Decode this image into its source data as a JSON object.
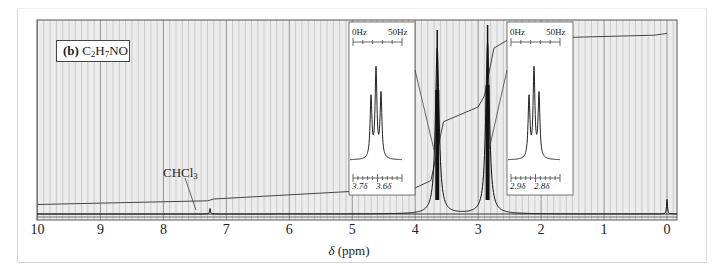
{
  "figure": {
    "panel_label": "(b)",
    "formula_parts": [
      "C",
      "2",
      "H",
      "7",
      "NO"
    ],
    "solvent_annotation": {
      "text": "CHCl",
      "sub": "3"
    }
  },
  "axis": {
    "xlabel_symbol": "δ",
    "xlabel_unit": "(ppm)",
    "ticks": [
      "10",
      "9",
      "8",
      "7",
      "6",
      "5",
      "4",
      "3",
      "2",
      "1",
      "0"
    ]
  },
  "insets": [
    {
      "hz_left": "0Hz",
      "hz_right": "50Hz",
      "ppm_left": "3.7δ",
      "ppm_right": "3.6δ"
    },
    {
      "hz_left": "0Hz",
      "hz_right": "50Hz",
      "ppm_left": "2.9δ",
      "ppm_right": "2.8δ"
    }
  ],
  "colors": {
    "grid_bg": "#ececec",
    "grid_line": "#a9a9a9",
    "trace": "#222222"
  },
  "chart_data": {
    "type": "line",
    "title": "(b) C2H7NO",
    "xlabel": "δ (ppm)",
    "ylabel": "",
    "xlim": [
      10,
      0
    ],
    "x_reversed": true,
    "grid": true,
    "peaks": [
      {
        "shift_ppm": 7.26,
        "label": "CHCl3",
        "relative_height": 0.03,
        "multiplicity": "singlet"
      },
      {
        "shift_ppm": 3.65,
        "relative_height": 0.92,
        "multiplicity": "triplet",
        "inset_range_ppm": [
          3.7,
          3.6
        ]
      },
      {
        "shift_ppm": 2.85,
        "relative_height": 0.95,
        "multiplicity": "triplet",
        "inset_range_ppm": [
          2.9,
          2.8
        ]
      },
      {
        "shift_ppm": 0.0,
        "label": "TMS",
        "relative_height": 0.08,
        "multiplicity": "singlet"
      }
    ],
    "integration_curve": {
      "x": [
        10,
        7.3,
        7.2,
        4.0,
        3.75,
        3.55,
        3.0,
        2.9,
        2.75,
        2.5,
        0.2,
        0.0
      ],
      "y": [
        0.03,
        0.05,
        0.06,
        0.12,
        0.16,
        0.48,
        0.56,
        0.62,
        0.88,
        0.93,
        0.95,
        0.96
      ]
    },
    "inset_scale": {
      "left": "0Hz",
      "right": "50Hz"
    }
  }
}
